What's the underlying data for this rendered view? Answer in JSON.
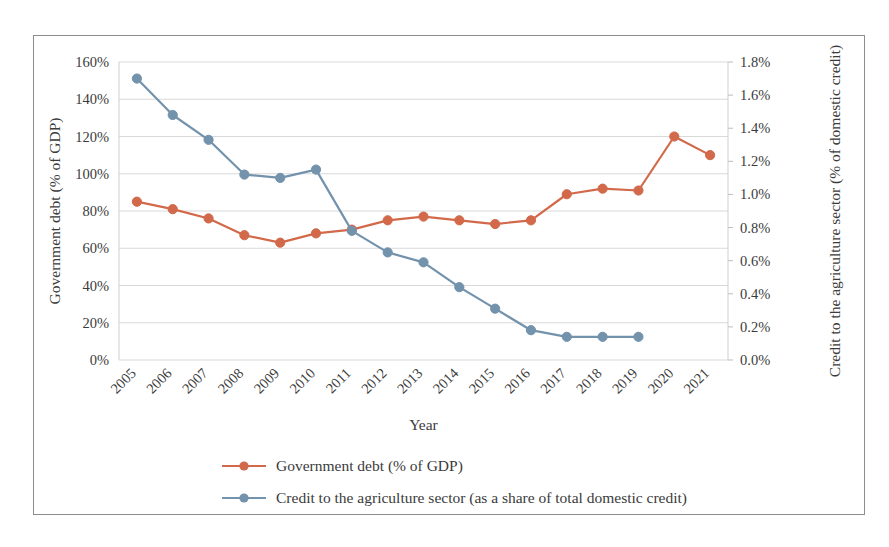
{
  "chart_data": {
    "type": "line",
    "title": "",
    "xlabel": "Year",
    "ylabel": "Government debt (% of GDP)",
    "y2label": "Credit to the agriculture sector (% of domestic credit)",
    "categories": [
      "2005",
      "2006",
      "2007",
      "2008",
      "2009",
      "2010",
      "2011",
      "2012",
      "2013",
      "2014",
      "2015",
      "2016",
      "2017",
      "2018",
      "2019",
      "2020",
      "2021"
    ],
    "ylim": [
      0,
      160
    ],
    "y2lim": [
      0,
      1.8
    ],
    "yticks": [
      "0%",
      "20%",
      "40%",
      "60%",
      "80%",
      "100%",
      "120%",
      "140%",
      "160%"
    ],
    "ytick_values": [
      0,
      20,
      40,
      60,
      80,
      100,
      120,
      140,
      160
    ],
    "y2ticks": [
      "0.0%",
      "0.2%",
      "0.4%",
      "0.6%",
      "0.8%",
      "1.0%",
      "1.2%",
      "1.4%",
      "1.6%",
      "1.8%"
    ],
    "y2tick_values": [
      0,
      0.2,
      0.4,
      0.6,
      0.8,
      1.0,
      1.2,
      1.4,
      1.6,
      1.8
    ],
    "grid": true,
    "legend_position": "bottom",
    "series": [
      {
        "name": "Government debt (% of GDP)",
        "axis": "left",
        "color": "#D2694A",
        "values": [
          85,
          81,
          76,
          67,
          63,
          68,
          70,
          75,
          77,
          75,
          73,
          75,
          89,
          92,
          91,
          120,
          110
        ]
      },
      {
        "name": "Credit to the agriculture sector (as a share of total domestic credit)",
        "axis": "right",
        "color": "#7392AC",
        "values": [
          1.7,
          1.48,
          1.33,
          1.12,
          1.1,
          1.15,
          0.78,
          0.65,
          0.59,
          0.44,
          0.31,
          0.18,
          0.14,
          0.14,
          0.14,
          null,
          null
        ]
      }
    ]
  },
  "legend": {
    "items": [
      {
        "label": "Government debt (% of GDP)",
        "color": "#D2694A"
      },
      {
        "label": "Credit to the agriculture sector (as a share of total domestic credit)",
        "color": "#7392AC"
      }
    ]
  },
  "colors": {
    "series_orange": "#D2694A",
    "series_blue": "#7392AC",
    "gridline": "#D9D9D9",
    "frame": "#8D8D8D",
    "text": "#3B3B3B"
  }
}
